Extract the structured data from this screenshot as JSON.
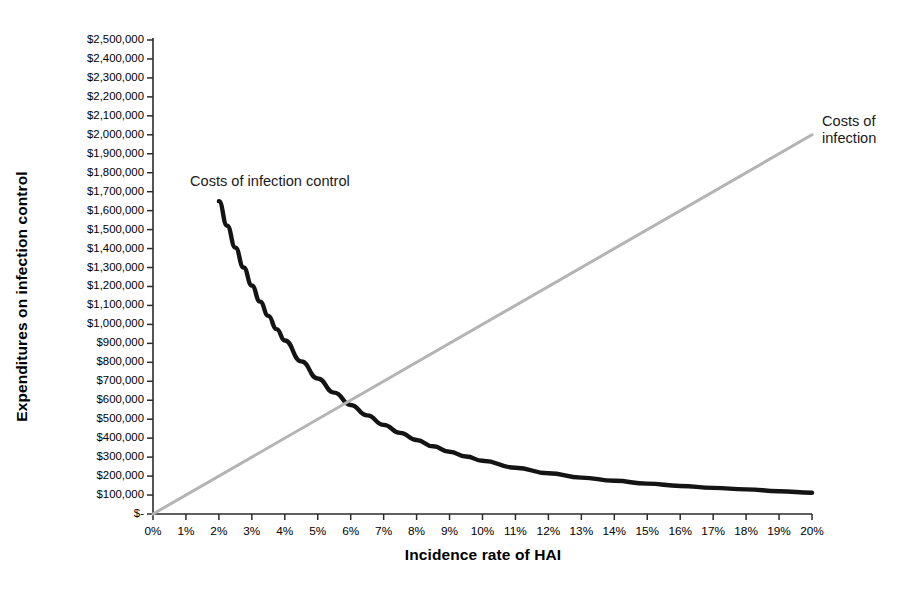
{
  "chart_data": {
    "type": "line",
    "title": "",
    "xlabel": "Incidence rate of HAI",
    "ylabel": "Expenditures on infection control",
    "xlim": [
      0,
      20
    ],
    "ylim": [
      0,
      2500000
    ],
    "grid": false,
    "legend_position": "inline-annotations",
    "x_tick_labels": [
      "0%",
      "1%",
      "2%",
      "3%",
      "4%",
      "5%",
      "6%",
      "7%",
      "8%",
      "9%",
      "10%",
      "11%",
      "12%",
      "13%",
      "14%",
      "15%",
      "16%",
      "17%",
      "18%",
      "19%",
      "20%"
    ],
    "x_tick_values": [
      0,
      1,
      2,
      3,
      4,
      5,
      6,
      7,
      8,
      9,
      10,
      11,
      12,
      13,
      14,
      15,
      16,
      17,
      18,
      19,
      20
    ],
    "y_tick_labels": [
      "$2,500,000",
      "$2,400,000",
      "$2,300,000",
      "$2,200,000",
      "$2,100,000",
      "$2,000,000",
      "$1,900,000",
      "$1,800,000",
      "$1,700,000",
      "$1,600,000",
      "$1,500,000",
      "$1,400,000",
      "$1,300,000",
      "$1,200,000",
      "$1,100,000",
      "$1,000,000",
      "$900,000",
      "$800,000",
      "$700,000",
      "$600,000",
      "$500,000",
      "$400,000",
      "$300,000",
      "$200,000",
      "$100,000",
      "$-"
    ],
    "y_tick_values": [
      2500000,
      2400000,
      2300000,
      2200000,
      2100000,
      2000000,
      1900000,
      1800000,
      1700000,
      1600000,
      1500000,
      1400000,
      1300000,
      1200000,
      1100000,
      1000000,
      900000,
      800000,
      700000,
      600000,
      500000,
      400000,
      300000,
      200000,
      100000,
      0
    ],
    "intersection": {
      "x": 6.3,
      "y": 630000
    },
    "series": [
      {
        "name": "Costs of infection control",
        "color": "#141414",
        "style": "solid",
        "x": [
          2.0,
          2.25,
          2.5,
          2.75,
          3.0,
          3.25,
          3.5,
          3.75,
          4.0,
          4.5,
          5.0,
          5.5,
          6.0,
          6.3,
          6.5,
          7.0,
          7.5,
          8.0,
          8.5,
          9.0,
          9.5,
          10.0,
          11.0,
          12.0,
          13.0,
          14.0,
          15.0,
          16.0,
          17.0,
          18.0,
          19.0,
          20.0
        ],
        "y": [
          1650000,
          1520000,
          1405000,
          1300000,
          1205000,
          1120000,
          1045000,
          975000,
          915000,
          805000,
          715000,
          640000,
          575000,
          630000,
          520000,
          470000,
          428000,
          390000,
          357000,
          328000,
          303000,
          281000,
          244000,
          215000,
          192000,
          175000,
          160000,
          148000,
          138000,
          130000,
          120000,
          112000
        ]
      },
      {
        "name": "Costs of infection",
        "color": "#b4b4b4",
        "style": "solid",
        "x": [
          0,
          20
        ],
        "y": [
          0,
          2000000
        ]
      }
    ]
  },
  "annotations": {
    "costs_of_infection_control": "Costs of infection control",
    "costs_of_infection_line1": "Costs of",
    "costs_of_infection_line2": "infection"
  }
}
